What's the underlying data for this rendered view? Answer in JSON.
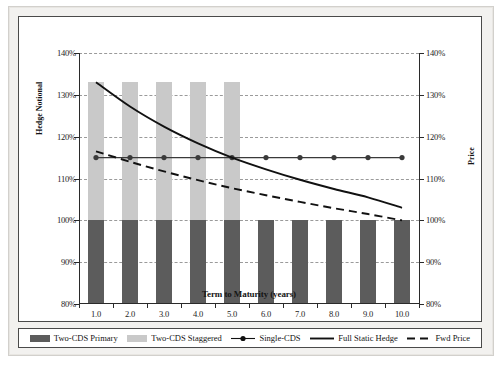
{
  "chart_data": {
    "type": "bar",
    "title": "",
    "subtitle": "",
    "xlabel": "Term to Maturity (years)",
    "ylabel": "Hedge Notional",
    "ylabel_right": "Price",
    "x": [
      1.0,
      2.0,
      3.0,
      4.0,
      5.0,
      6.0,
      7.0,
      8.0,
      9.0,
      10.0
    ],
    "xtick_labels": [
      "1.0",
      "2.0",
      "3.0",
      "4.0",
      "5.0",
      "6.0",
      "7.0",
      "8.0",
      "9.0",
      "10.0"
    ],
    "ylim": [
      80,
      140
    ],
    "ytick_labels": [
      "80%",
      "90%",
      "100%",
      "110%",
      "120%",
      "130%",
      "140%"
    ],
    "ytick_values": [
      80,
      90,
      100,
      110,
      120,
      130,
      140
    ],
    "ylim_right": [
      80,
      140
    ],
    "ytick_labels_right": [
      "80%",
      "90%",
      "100%",
      "110%",
      "120%",
      "130%",
      "140%"
    ],
    "grid": true,
    "legend_position": "bottom",
    "series": [
      {
        "name": "Two-CDS Primary",
        "type": "bar",
        "color": "#5c5c5c",
        "baseline": 80,
        "values": [
          100,
          100,
          100,
          100,
          100,
          100,
          100,
          100,
          100,
          100
        ]
      },
      {
        "name": "Two-CDS Staggered",
        "type": "bar",
        "color": "#c9c9c9",
        "baseline": 100,
        "values": [
          133,
          133,
          133,
          133,
          133,
          null,
          null,
          null,
          null,
          null
        ]
      },
      {
        "name": "Single-CDS",
        "type": "line",
        "color": "#3a3a3a",
        "marker": "circle",
        "values": [
          115,
          115,
          115,
          115,
          115,
          115,
          115,
          115,
          115,
          115
        ]
      },
      {
        "name": "Full Static Hedge",
        "type": "line",
        "color": "#111111",
        "style": "solid",
        "values": [
          133.0,
          127.2,
          122.4,
          118.4,
          115.0,
          112.2,
          109.7,
          107.5,
          105.5,
          103.0
        ]
      },
      {
        "name": "Fwd Price",
        "type": "line",
        "color": "#111111",
        "style": "dashed",
        "values": [
          116.5,
          114.0,
          111.7,
          109.6,
          107.7,
          106.0,
          104.4,
          102.9,
          101.5,
          100.0
        ]
      }
    ]
  },
  "legend": {
    "items": [
      {
        "label": "Two-CDS Primary",
        "kind": "swatch-dark"
      },
      {
        "label": "Two-CDS Staggered",
        "kind": "swatch-light"
      },
      {
        "label": "Single-CDS",
        "kind": "line-marker"
      },
      {
        "label": "Full Static Hedge",
        "kind": "line-solid"
      },
      {
        "label": "Fwd Price",
        "kind": "line-dashed"
      }
    ]
  },
  "colors": {
    "bar_primary": "#5c5c5c",
    "bar_staggered": "#c9c9c9",
    "line": "#111111",
    "grid": "#9a9a9a",
    "axis": "#2a2a2a",
    "page_background": "#f2f1ef"
  }
}
